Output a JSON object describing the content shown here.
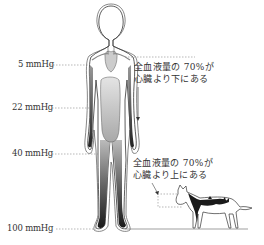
{
  "diagram": {
    "pressure_labels": [
      {
        "text": "5 mmHg",
        "y": 65
      },
      {
        "text": "22 mmHg",
        "y": 108
      },
      {
        "text": "40 mmHg",
        "y": 154
      },
      {
        "text": "100 mmHg",
        "y": 229
      }
    ],
    "human_note": {
      "line1": "全血液量の 70%が",
      "line2": "心臓より下にある"
    },
    "dog_note": {
      "line1": "全血液量の 70%が",
      "line2": "心臓より上にある"
    },
    "colors": {
      "outline": "#444444",
      "blood_dark": "#222222",
      "blood_light": "#d8d8d8",
      "dashes": "#888888",
      "text": "#333333"
    }
  }
}
